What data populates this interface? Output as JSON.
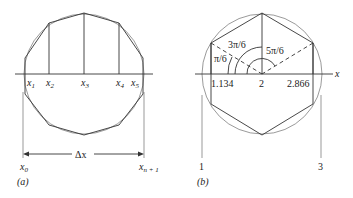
{
  "panel_a": {
    "caption": "(a)",
    "nodes": [
      {
        "label": "x",
        "sub": "1"
      },
      {
        "label": "x",
        "sub": "2"
      },
      {
        "label": "x",
        "sub": "3"
      },
      {
        "label": "x",
        "sub": "4"
      },
      {
        "label": "x",
        "sub": "5"
      }
    ],
    "x0": {
      "label": "x",
      "sub": "0"
    },
    "xn1": {
      "label": "x",
      "sub": "n + 1"
    },
    "delta": "Δx"
  },
  "panel_b": {
    "caption": "(b)",
    "axis_label": "x",
    "angles": [
      "π/6",
      "3π/6",
      "5π/6"
    ],
    "ticks": [
      "1.134",
      "2",
      "2.866"
    ],
    "bounds": [
      "1",
      "3"
    ]
  }
}
